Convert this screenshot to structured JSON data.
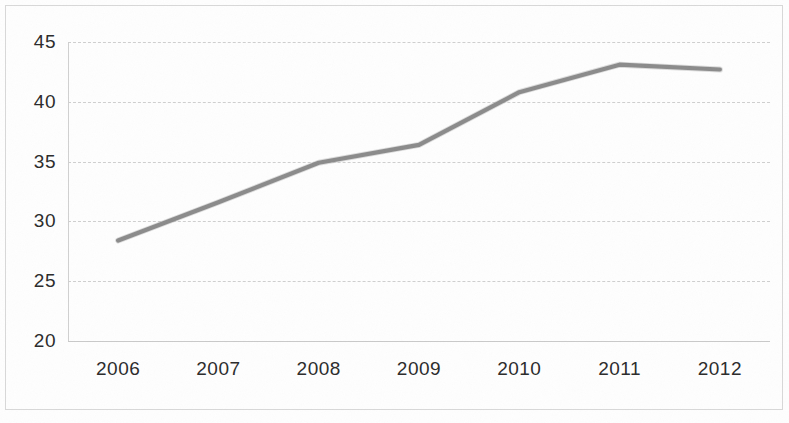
{
  "chart_data": {
    "type": "line",
    "title": "",
    "subtitle": "",
    "xlabel": "",
    "ylabel": "",
    "categories": [
      "2006",
      "2007",
      "2008",
      "2009",
      "2010",
      "2011",
      "2012"
    ],
    "series": [
      {
        "name": "",
        "values": [
          28.4,
          31.6,
          34.9,
          36.4,
          40.8,
          43.1,
          42.7
        ],
        "color": "#8b8b8b"
      }
    ],
    "ylim": [
      20,
      45
    ],
    "y_ticks": [
      "20",
      "25",
      "30",
      "35",
      "40",
      "45"
    ],
    "y_tick_values": [
      20,
      25,
      30,
      35,
      40,
      45
    ],
    "x_ticks": [
      "2006",
      "2007",
      "2008",
      "2009",
      "2010",
      "2011",
      "2012"
    ],
    "grid": true,
    "grid_axis": "y",
    "grid_color": "#cfcfcf",
    "legend": false,
    "legend_position": "none",
    "annotations": [],
    "plot_background": "#ffffff",
    "line_color": "#8b8b8b",
    "axis_text_color": "#2b2b2b"
  },
  "figure": {
    "border_color": "#d8d8d8",
    "background": "#fefefe"
  }
}
